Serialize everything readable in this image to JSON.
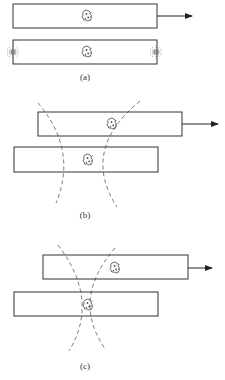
{
  "panels": [
    {
      "id": "a",
      "label": "(a)",
      "label_pos": {
        "x": 85,
        "y": 72
      },
      "top_bar": {
        "x": 13,
        "y": 4,
        "w": 144,
        "h": 24,
        "creature": {
          "x": 87,
          "y": 16
        }
      },
      "bottom_bar": {
        "x": 13,
        "y": 40,
        "w": 144,
        "h": 24,
        "creature": {
          "x": 87,
          "y": 52
        }
      },
      "arrow": {
        "x1": 157,
        "y": 16,
        "x2": 192
      },
      "bursts": [
        {
          "x": 13,
          "y": 52
        },
        {
          "x": 156,
          "y": 52
        }
      ]
    },
    {
      "id": "b",
      "label": "(b)",
      "label_pos": {
        "x": 85,
        "y": 210
      },
      "top_bar": {
        "x": 38,
        "y": 112,
        "w": 144,
        "h": 24,
        "creature": {
          "x": 112,
          "y": 124
        }
      },
      "bottom_bar": {
        "x": 14,
        "y": 147,
        "w": 144,
        "h": 25,
        "creature": {
          "x": 88,
          "y": 160
        }
      },
      "arrow": {
        "x1": 182,
        "y": 124,
        "x2": 218
      }
    },
    {
      "id": "c",
      "label": "(c)",
      "label_pos": {
        "x": 85,
        "y": 362
      },
      "top_bar": {
        "x": 43,
        "y": 255,
        "w": 145,
        "h": 24,
        "creature": {
          "x": 115,
          "y": 268
        }
      },
      "bottom_bar": {
        "x": 14,
        "y": 292,
        "w": 144,
        "h": 24,
        "creature": {
          "x": 88,
          "y": 305
        }
      },
      "arrow": {
        "x1": 188,
        "y": 268,
        "x2": 212
      }
    }
  ],
  "colors": {
    "line": "#333333",
    "dash": "#555555",
    "background": "#ffffff"
  }
}
